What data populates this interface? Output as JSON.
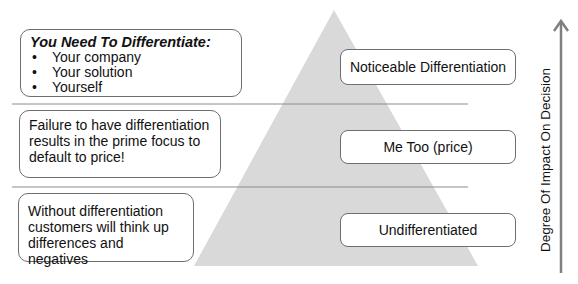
{
  "diagram": {
    "type": "pyramid",
    "colors": {
      "pyramid_fill": "#d9d9d9",
      "divider": "#8c8c8c",
      "box_border": "#6e6e6e",
      "arrow": "#808080",
      "text": "#111111"
    },
    "levels": [
      {
        "position": "top",
        "label": "Noticeable Differentiation",
        "note": {
          "heading": "You Need To Differentiate:",
          "bullets": [
            "Your company",
            "Your solution",
            "Yourself"
          ]
        }
      },
      {
        "position": "middle",
        "label": "Me Too (price)",
        "note": {
          "text": "Failure to have differentiation results in the prime focus to default to price!"
        }
      },
      {
        "position": "bottom",
        "label": "Undifferentiated",
        "note": {
          "text": "Without differentiation customers will think up differences and negatives"
        }
      }
    ],
    "axis": {
      "label": "Degree Of Impact On Decision",
      "direction": "up"
    }
  }
}
